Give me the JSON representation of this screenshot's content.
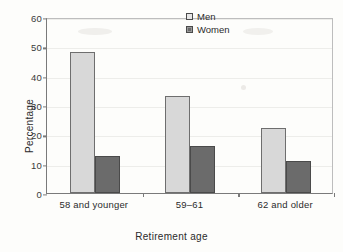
{
  "chart_data": {
    "type": "bar",
    "title": "",
    "xlabel": "Retirement age",
    "ylabel": "Percentage",
    "categories": [
      "58 and younger",
      "59–61",
      "62 and older"
    ],
    "series": [
      {
        "name": "Men",
        "values": [
          48,
          33,
          22
        ],
        "color": "#d8d8d8"
      },
      {
        "name": "Women",
        "values": [
          12.7,
          16,
          10.8
        ],
        "color": "#6b6b6b"
      }
    ],
    "ylim": [
      0,
      60
    ],
    "yticks": [
      "0",
      "10",
      "20",
      "30",
      "40",
      "50",
      "60"
    ],
    "ytick_values": [
      0,
      10,
      20,
      30,
      40,
      50,
      60
    ],
    "grid": true,
    "legend_position": "top-right"
  },
  "legend": {
    "men_label": "Men",
    "women_label": "Women"
  },
  "axes": {
    "y_title": "Percentage",
    "x_title": "Retirement age"
  }
}
